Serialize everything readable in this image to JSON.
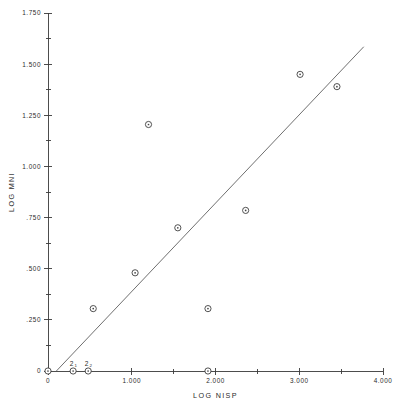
{
  "chart_data": {
    "type": "scatter",
    "title": "",
    "xlabel": "LOG NISP",
    "ylabel": "LOG MNI",
    "xlim": [
      0,
      4.0
    ],
    "ylim": [
      0,
      1.75
    ],
    "grid": false,
    "legend": null,
    "x_ticks": [
      {
        "value": 0,
        "label": "0"
      },
      {
        "value": 1.0,
        "label": "1.000"
      },
      {
        "value": 2.0,
        "label": "2.000"
      },
      {
        "value": 3.0,
        "label": "3.000"
      },
      {
        "value": 4.0,
        "label": "4.000"
      }
    ],
    "x_minor_ticks": [
      0.5,
      1.5,
      2.5,
      3.5
    ],
    "y_ticks": [
      {
        "value": 0,
        "label": "0"
      },
      {
        "value": 0.25,
        "label": ".250"
      },
      {
        "value": 0.5,
        "label": ".500"
      },
      {
        "value": 0.75,
        "label": ".750"
      },
      {
        "value": 1.0,
        "label": "1.000"
      },
      {
        "value": 1.25,
        "label": "1.250"
      },
      {
        "value": 1.5,
        "label": "1.500"
      },
      {
        "value": 1.75,
        "label": "1.750"
      }
    ],
    "y_minor_ticks": [
      0.125,
      0.375,
      0.625,
      0.875,
      1.125,
      1.375,
      1.625
    ],
    "points": [
      {
        "x": 0.0,
        "y": 0.0,
        "count": 1
      },
      {
        "x": 0.3,
        "y": 0.0,
        "count": 2
      },
      {
        "x": 0.48,
        "y": 0.0,
        "count": 2
      },
      {
        "x": 0.54,
        "y": 0.305,
        "count": 1
      },
      {
        "x": 1.04,
        "y": 0.48,
        "count": 1
      },
      {
        "x": 1.2,
        "y": 1.205,
        "count": 1
      },
      {
        "x": 1.55,
        "y": 0.7,
        "count": 1
      },
      {
        "x": 1.91,
        "y": 0.305,
        "count": 1
      },
      {
        "x": 1.91,
        "y": 0.0,
        "count": 1
      },
      {
        "x": 2.36,
        "y": 0.785,
        "count": 1
      },
      {
        "x": 3.01,
        "y": 1.45,
        "count": 1
      },
      {
        "x": 3.45,
        "y": 1.39,
        "count": 1
      }
    ],
    "overlap_labels": [
      {
        "x": 0.3,
        "y": 0.0,
        "label": "2",
        "sub": "1"
      },
      {
        "x": 0.48,
        "y": 0.0,
        "label": "2",
        "sub": "2"
      }
    ],
    "fit_line": {
      "x1": 0.1,
      "y1": 0.0,
      "x2": 3.77,
      "y2": 1.585
    }
  }
}
